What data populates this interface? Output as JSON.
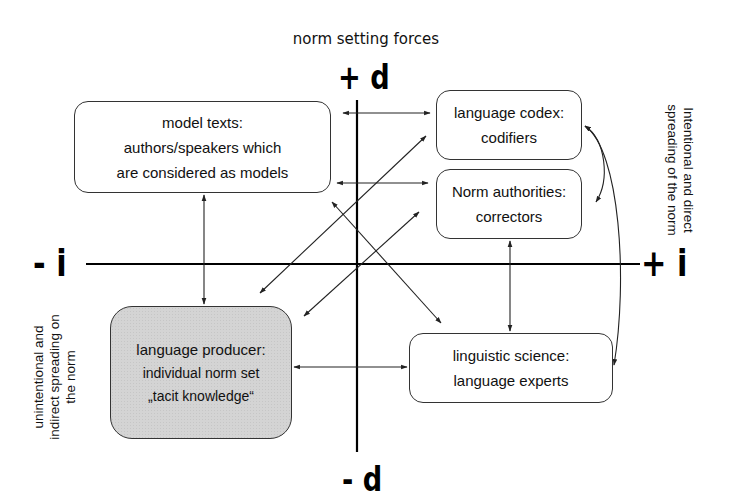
{
  "title": "norm setting forces",
  "axes": {
    "top": "+ d",
    "bottom": "- d",
    "left": "- i",
    "right": "+ i"
  },
  "side_labels": {
    "left_line1": "unintentional and",
    "left_line2": "indirect spreading on",
    "left_line3": "the norm",
    "right_line1": "Intentional and direct",
    "right_line2": "spreading of the norm"
  },
  "boxes": {
    "model_texts": {
      "heading": "model texts:",
      "line1": "authors/speakers which",
      "line2": "are considered as models"
    },
    "language_codex": {
      "heading": "language codex:",
      "line1": "codifiers"
    },
    "norm_authorities": {
      "heading": "Norm authorities:",
      "line1": "correctors"
    },
    "language_producer": {
      "heading": "language producer:",
      "line1": "individual norm set",
      "line2": "„tacit knowledge“"
    },
    "linguistic_science": {
      "heading": "linguistic science:",
      "line1": "language experts"
    }
  },
  "colors": {
    "line": "#222222",
    "producer_fill": "#d4d4d4",
    "box_border": "#333333"
  }
}
